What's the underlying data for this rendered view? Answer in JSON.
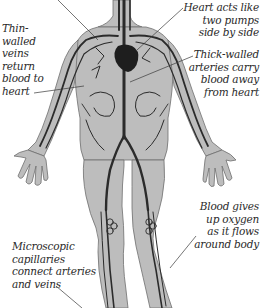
{
  "diagram": {
    "colors": {
      "body_fill": "#bdbdbd",
      "body_outline": "#6e6e6e",
      "vessel": "#2b2b2b",
      "heart": "#1e1e1e",
      "label_text": "#2a2a2a",
      "leader_line": "#3a3a3a"
    },
    "labels": [
      {
        "id": "veins",
        "lines": [
          "Thin-",
          "walled",
          "veins",
          "return",
          "blood to",
          "heart"
        ]
      },
      {
        "id": "heart",
        "lines": [
          "Heart acts like",
          "two pumps",
          "side by side"
        ]
      },
      {
        "id": "arteries",
        "lines": [
          "Thick-walled",
          "arteries carry",
          "blood away",
          "from heart"
        ]
      },
      {
        "id": "oxygen",
        "lines": [
          "Blood gives",
          "up oxygen",
          "as it flows",
          "around body"
        ]
      },
      {
        "id": "capillaries",
        "lines": [
          "Microscopic",
          "capillaries",
          "connect arteries",
          "and veins"
        ]
      }
    ]
  }
}
